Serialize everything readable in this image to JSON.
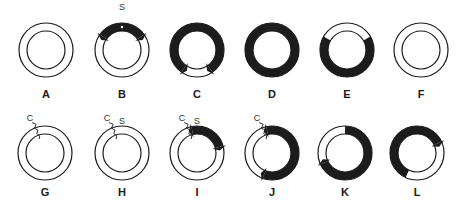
{
  "figure": {
    "ink_color": "#1c1c1c",
    "background": "#ffffff",
    "outer_radius": 27,
    "inner_radius": 19,
    "panels": [
      {
        "id": "A",
        "label": "A",
        "cx": 46,
        "cy": 50,
        "filled": [],
        "arrows": [],
        "marker": null,
        "annotations": []
      },
      {
        "id": "B",
        "label": "B",
        "cx": 122,
        "cy": 50,
        "filled": [
          [
            -55,
            55
          ]
        ],
        "arrows": [
          -55,
          55
        ],
        "marker": null,
        "dot": true,
        "annotations": [
          {
            "text": "S",
            "dx": 0,
            "dy": -42
          }
        ]
      },
      {
        "id": "C",
        "label": "C",
        "cx": 197,
        "cy": 50,
        "filled": [
          [
            -145,
            145
          ]
        ],
        "arrows": [
          -145,
          145
        ],
        "marker": null,
        "annotations": []
      },
      {
        "id": "D",
        "label": "D",
        "cx": 272,
        "cy": 50,
        "filled": [
          [
            0,
            360
          ]
        ],
        "arrows": [],
        "marker": null,
        "annotations": []
      },
      {
        "id": "E",
        "label": "E",
        "cx": 347,
        "cy": 50,
        "filled": [
          [
            60,
            300
          ]
        ],
        "arrows": [],
        "marker": null,
        "annotations": []
      },
      {
        "id": "F",
        "label": "F",
        "cx": 421,
        "cy": 50,
        "filled": [],
        "arrows": [],
        "marker": null,
        "annotations": []
      },
      {
        "id": "G",
        "label": "G",
        "cx": 45,
        "cy": 153,
        "filled": [],
        "arrows": [],
        "marker": -20,
        "annotations": [
          {
            "text": "C",
            "dx": -15,
            "dy": -34
          }
        ]
      },
      {
        "id": "H",
        "label": "H",
        "cx": 122,
        "cy": 153,
        "filled": [],
        "arrows": [],
        "marker": -20,
        "annotations": [
          {
            "text": "C",
            "dx": -15,
            "dy": -34
          },
          {
            "text": "S",
            "dx": 0,
            "dy": -31
          }
        ]
      },
      {
        "id": "I",
        "label": "I",
        "cx": 197,
        "cy": 153,
        "filled": [
          [
            -12,
            75
          ]
        ],
        "arrows": [
          -12,
          75
        ],
        "marker": -20,
        "annotations": [
          {
            "text": "C",
            "dx": -15,
            "dy": -34
          },
          {
            "text": "S",
            "dx": 0,
            "dy": -31
          }
        ]
      },
      {
        "id": "J",
        "label": "J",
        "cx": 272,
        "cy": 153,
        "filled": [
          [
            -12,
            200
          ]
        ],
        "arrows": [
          -12,
          200
        ],
        "marker": -20,
        "annotations": [
          {
            "text": "C",
            "dx": -15,
            "dy": -34
          }
        ]
      },
      {
        "id": "K",
        "label": "K",
        "cx": 345,
        "cy": 153,
        "filled": [
          [
            0,
            245
          ]
        ],
        "arrows": [
          245
        ],
        "marker": null,
        "annotations": []
      },
      {
        "id": "L",
        "label": "L",
        "cx": 417,
        "cy": 153,
        "filled": [
          [
            -155,
            65
          ]
        ],
        "arrows": [
          65
        ],
        "marker": null,
        "annotations": []
      }
    ]
  },
  "labels": {
    "row1_y": 88,
    "row2_y": 186
  }
}
